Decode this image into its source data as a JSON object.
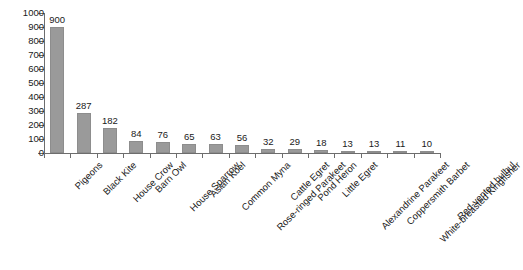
{
  "chart_data": {
    "type": "bar",
    "title": "",
    "subtitle": "",
    "xlabel": "",
    "ylabel": "",
    "ylim": [
      0,
      1000
    ],
    "ytick_step": 100,
    "yticks": [
      1000,
      900,
      800,
      700,
      600,
      500,
      400,
      300,
      200,
      100,
      0
    ],
    "grid": false,
    "legend": null,
    "bar_color": "#9a9a9a",
    "axis_color": "#6d6d6d",
    "text_color": "#1a1a1a",
    "show_value_labels": true,
    "categories": [
      "Pigeons",
      "Black Kite",
      "House Crow",
      "Barn Owl",
      "House Sparrow",
      "Asian Koel",
      "Common Myna",
      "Rose-ringed Parakeet",
      "Cattle Egret",
      "Pond Heron",
      "Little Egret",
      "Alexandrine Parakeet",
      "Coppersmith Barbet",
      "White-breasted Kingfisher",
      "Red-vented bulbul"
    ],
    "values": [
      900,
      287,
      182,
      84,
      76,
      65,
      63,
      56,
      32,
      29,
      18,
      13,
      13,
      11,
      10
    ]
  }
}
